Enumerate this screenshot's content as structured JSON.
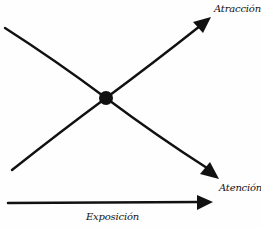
{
  "diagram": {
    "type": "crossing-arrows",
    "labels": {
      "rising": "Atracción",
      "falling": "Atención",
      "axis": "Exposición"
    },
    "colors": {
      "ink": "#111111",
      "background": "#fefefe"
    },
    "lines": [
      {
        "name": "atraccion-line",
        "from": [
          12,
          170
        ],
        "to": [
          210,
          18
        ],
        "label": "Atracción"
      },
      {
        "name": "atencion-line",
        "from": [
          5,
          28
        ],
        "to": [
          218,
          178
        ],
        "label": "Atención"
      },
      {
        "name": "exposicion-axis",
        "from": [
          8,
          203
        ],
        "to": [
          213,
          203
        ],
        "label": "Exposición"
      }
    ],
    "intersection": {
      "x": 106,
      "y": 98
    }
  }
}
